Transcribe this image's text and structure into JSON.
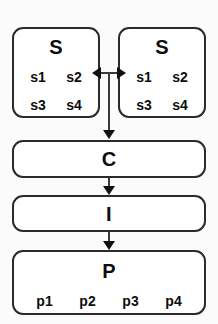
{
  "diagram": {
    "type": "flowchart",
    "background_color": "#fbfbfb",
    "line_color": "#2b2b2b",
    "box_fill_color": "#ffffff",
    "nodes": [
      {
        "id": "s-left",
        "title": "S",
        "leaves": [
          "s1",
          "s2",
          "s3",
          "s4"
        ]
      },
      {
        "id": "s-right",
        "title": "S",
        "leaves": [
          "s1",
          "s2",
          "s3",
          "s4"
        ]
      },
      {
        "id": "c",
        "title": "C",
        "leaves": []
      },
      {
        "id": "i",
        "title": "I",
        "leaves": []
      },
      {
        "id": "p",
        "title": "P",
        "leaves": [
          "p1",
          "p2",
          "p3",
          "p4"
        ]
      }
    ],
    "edges": [
      {
        "id": "s-left-to-s-right",
        "from": "s-left",
        "to": "s-right",
        "direction": "bidirectional"
      },
      {
        "id": "s-junction-to-c",
        "from": "s-left",
        "to": "c",
        "direction": "down"
      },
      {
        "id": "c-to-i",
        "from": "c",
        "to": "i",
        "direction": "down"
      },
      {
        "id": "i-to-p",
        "from": "i",
        "to": "p",
        "direction": "down"
      }
    ]
  }
}
